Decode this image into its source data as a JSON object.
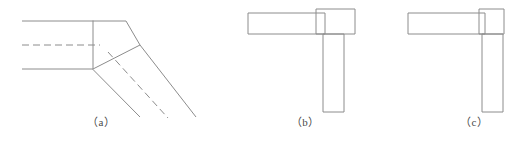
{
  "figure": {
    "background_color": "#ffffff",
    "line_color": "#8c8c8c",
    "caption_color": "#4a4a4a",
    "panels": [
      {
        "id": "a",
        "caption": "（a）",
        "description": "mitred oblique branch joint with centrelines"
      },
      {
        "id": "b",
        "caption": "（b）",
        "description": "tee joint with overlapping corner block"
      },
      {
        "id": "c",
        "caption": "（c）",
        "description": "corner joint with square corner block"
      }
    ]
  }
}
